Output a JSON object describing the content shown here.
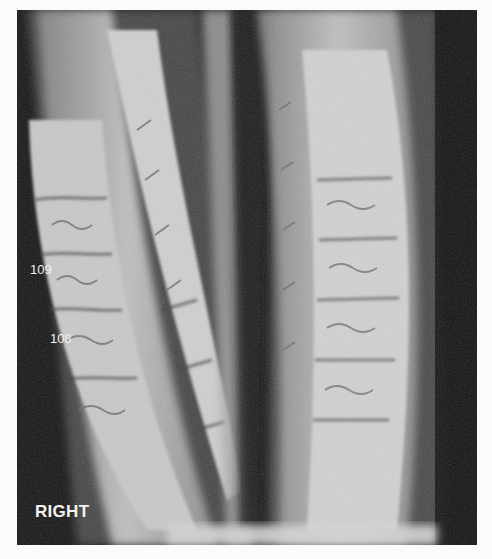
{
  "figure": {
    "labels": {
      "tooth_upper": "109",
      "tooth_lower": "108",
      "side": "RIGHT"
    },
    "colors": {
      "background": "#141414",
      "label_text": "#f2f2f2",
      "page": "#fbfbfb"
    }
  }
}
